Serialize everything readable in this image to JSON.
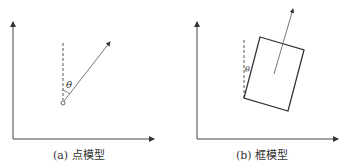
{
  "panels": [
    {
      "id": "a",
      "caption": "(a) 点模型",
      "angle_label": "θ"
    },
    {
      "id": "b",
      "caption": "(b) 框模型",
      "angle_label": "θ"
    }
  ],
  "colors": {
    "stroke": "#333333",
    "background": "#ffffff"
  }
}
